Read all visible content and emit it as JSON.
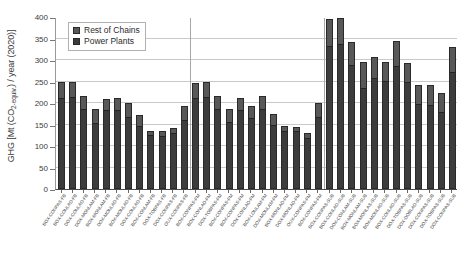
{
  "chart_data": {
    "type": "bar",
    "title": "",
    "subtitle": "",
    "xlabel": "",
    "ylabel": "GHG [Mt (CO2-equiv.) / year (2020)]",
    "ylabel_parts": {
      "prefix": "GHG [Mt (CO",
      "sub": "2-equiv.",
      "suffix": ") / year (2020)]"
    },
    "ylim": [
      0,
      400
    ],
    "ytick_step": 50,
    "yticks": [
      0,
      50,
      100,
      150,
      200,
      250,
      300,
      350,
      400
    ],
    "ytick_labels": [
      "0",
      "50",
      "100",
      "150",
      "200",
      "250",
      "300",
      "350",
      "400"
    ],
    "grid": true,
    "grid_axis": "y",
    "stacked": true,
    "legend_position": "top-left",
    "legend": [
      {
        "name": "Rest of Chains",
        "color": "#585858"
      },
      {
        "name": "Power Plants",
        "color": "#3c3c3c"
      }
    ],
    "series": [
      {
        "name": "Power Plants",
        "color": "#3c3c3c",
        "values": [
          212,
          214,
          185,
          154,
          183,
          184,
          168,
          146,
          126,
          123,
          130,
          160,
          211,
          213,
          186,
          155,
          184,
          164,
          185,
          150,
          136,
          134,
          119,
          168,
          333,
          338,
          288,
          234,
          258,
          252,
          286,
          248,
          198,
          195,
          179,
          272
        ]
      },
      {
        "name": "Rest of Chains",
        "color": "#585858",
        "values": [
          36,
          36,
          31,
          32,
          27,
          28,
          31,
          25,
          10,
          11,
          12,
          32,
          36,
          36,
          31,
          32,
          27,
          28,
          31,
          25,
          10,
          11,
          12,
          32,
          63,
          60,
          54,
          61,
          49,
          44,
          58,
          45,
          45,
          46,
          44,
          58
        ]
      }
    ],
    "totals": [
      248,
      250,
      216,
      186,
      210,
      212,
      199,
      171,
      136,
      134,
      142,
      192,
      247,
      249,
      217,
      187,
      211,
      192,
      216,
      175,
      146,
      145,
      131,
      200,
      396,
      398,
      342,
      295,
      307,
      296,
      344,
      293,
      243,
      241,
      223,
      330
    ],
    "group_separators_after": [
      11,
      23
    ],
    "categories": [
      "BOX-CONPAS-FB",
      "BOX-CONLAD-FB",
      "DOX-CONLAD-FB",
      "DOX-MONLAM-FB",
      "BOX-MONLAM-FB",
      "DOX-MONLAD-FB",
      "BOX-MONLAD-FB",
      "DOX-CONLAD-FB",
      "BOX-CONLAM-FB",
      "DOX-TOBPAS-FB",
      "DOX-CONPAS-FB",
      "OUX-CONPAS-FB",
      "BOX-CONPAS-FM",
      "BOX-CONLAD-FM",
      "DOX-TOBPAS-FM",
      "BOX-CONPAS-FM",
      "BOX-CONPAS-FM",
      "DOX-CONLAD-FM",
      "BOX-LONLAM-FM",
      "DOX-MONLAM-FM",
      "BOX-MONLAD-FM",
      "DOX-MONLAD-FM",
      "OUX-CONPAS-FM",
      "BOX-CONPAS-FM",
      "BOX-CONPAS-SUB",
      "BOX-CONLAD-SUB",
      "DOX-CONLAM-SUB",
      "BOX-MONLAM-SUB",
      "BOX-MONLAS-SUB",
      "BOX-MONLAD-SUB",
      "BOX-CONLAD-SUB",
      "DOX-TOBPAS-SUB",
      "DOX-DOBLAD-SUB",
      "DOX-CONPAS-SUB",
      "DOX-TOBPAS-SUB",
      "DOX-CONPAS-SUB"
    ]
  }
}
